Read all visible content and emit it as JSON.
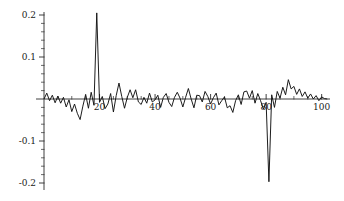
{
  "chart_data": {
    "type": "line",
    "title": "",
    "subtitle": "",
    "xlabel": "",
    "ylabel": "",
    "xlim": [
      0,
      103
    ],
    "ylim": [
      -0.21,
      0.21
    ],
    "grid": false,
    "legend": null,
    "legend_position": "none",
    "series_name": "residual-series",
    "line_color": "#111111",
    "axis_color": "#2b2b2b",
    "background_color": "#ffffff",
    "y_ticks_major": [
      0.2,
      0.1,
      -0.1,
      -0.2
    ],
    "y_tick_labels": [
      "0.2",
      "0.1",
      "-0.1",
      "-0.2"
    ],
    "y_tick_minor_step": 0.02,
    "x_ticks_major": [
      20,
      40,
      60,
      80,
      100
    ],
    "x_tick_labels": [
      "20",
      "40",
      "60",
      "80",
      "100"
    ],
    "x_tick_minor_step": 5,
    "zero_line_value": 0,
    "annotations": [
      {
        "label": "positive-spike",
        "x": 19,
        "y": 0.205
      },
      {
        "label": "negative-spike",
        "x": 81,
        "y": -0.197
      }
    ],
    "x": [
      0,
      1,
      2,
      3,
      4,
      5,
      6,
      7,
      8,
      9,
      10,
      11,
      12,
      13,
      14,
      15,
      16,
      17,
      18,
      19,
      20,
      21,
      22,
      23,
      24,
      25,
      26,
      27,
      28,
      29,
      30,
      31,
      32,
      33,
      34,
      35,
      36,
      37,
      38,
      39,
      40,
      41,
      42,
      43,
      44,
      45,
      46,
      47,
      48,
      49,
      50,
      51,
      52,
      53,
      54,
      55,
      56,
      57,
      58,
      59,
      60,
      61,
      62,
      63,
      64,
      65,
      66,
      67,
      68,
      69,
      70,
      71,
      72,
      73,
      74,
      75,
      76,
      77,
      78,
      79,
      80,
      81,
      82,
      83,
      84,
      85,
      86,
      87,
      88,
      89,
      90,
      91,
      92,
      93,
      94,
      95,
      96,
      97,
      98,
      99,
      100,
      101,
      102
    ],
    "y": [
      0.0,
      0.014,
      -0.004,
      0.009,
      -0.009,
      0.007,
      -0.01,
      0.004,
      -0.019,
      -0.002,
      -0.03,
      -0.012,
      -0.034,
      -0.049,
      -0.017,
      0.011,
      -0.022,
      0.016,
      -0.015,
      0.205,
      -0.008,
      0.006,
      -0.023,
      -0.012,
      0.013,
      -0.031,
      0.008,
      0.038,
      0.006,
      -0.022,
      0.004,
      0.022,
      0.003,
      0.022,
      -0.007,
      -0.013,
      0.004,
      -0.01,
      0.014,
      -0.007,
      -0.002,
      0.009,
      -0.02,
      0.004,
      0.013,
      -0.008,
      -0.018,
      0.004,
      0.016,
      0.002,
      -0.019,
      0.004,
      0.025,
      0.0,
      -0.021,
      0.009,
      0.008,
      -0.007,
      0.018,
      0.006,
      -0.012,
      0.003,
      0.014,
      -0.014,
      -0.004,
      0.005,
      -0.021,
      -0.016,
      -0.032,
      -0.004,
      0.01,
      -0.013,
      0.017,
      0.019,
      0.002,
      0.02,
      -0.01,
      0.013,
      -0.004,
      -0.024,
      -0.008,
      -0.197,
      0.01,
      -0.02,
      0.018,
      0.002,
      0.028,
      0.01,
      0.046,
      0.024,
      0.03,
      0.011,
      0.024,
      0.006,
      0.017,
      0.002,
      0.012,
      0.0,
      0.008,
      -0.004,
      0.005,
      0.001,
      0.0
    ]
  }
}
